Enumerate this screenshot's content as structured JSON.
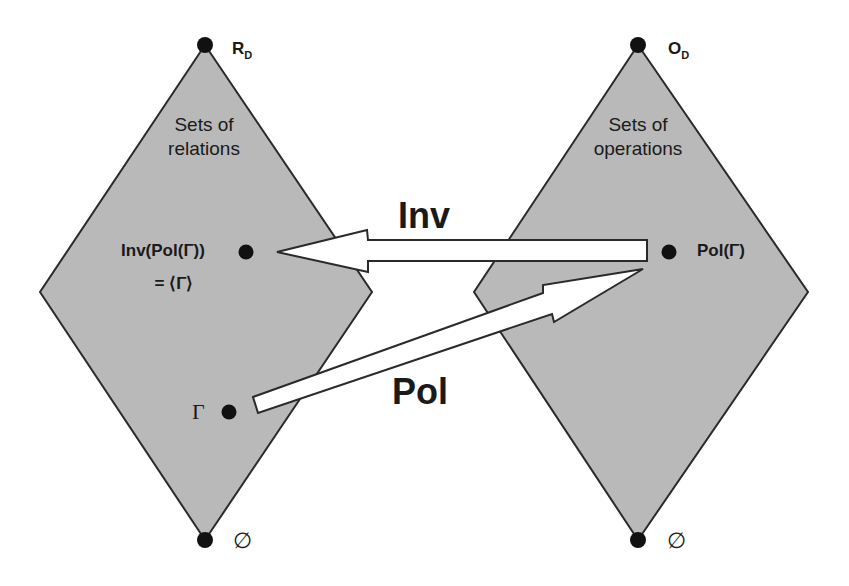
{
  "colors": {
    "diamond_fill": "#b9b9b9",
    "outline": "#2a2a2a",
    "arrow_fill": "#ffffff",
    "dot": "#111111"
  },
  "left_diamond": {
    "title_line1": "Sets of",
    "title_line2": "relations",
    "top_label": "R",
    "top_label_sub": "D",
    "bottom_label": "∅",
    "points": {
      "closure_line1": "Inv(Pol(Γ))",
      "closure_line2": "= ⟨Γ⟩",
      "gamma": "Γ"
    }
  },
  "right_diamond": {
    "title_line1": "Sets of",
    "title_line2": "operations",
    "top_label": "O",
    "top_label_sub": "D",
    "bottom_label": "∅",
    "points": {
      "pol": "Pol(Γ)"
    }
  },
  "arrows": {
    "inv": "Inv",
    "pol": "Pol"
  }
}
